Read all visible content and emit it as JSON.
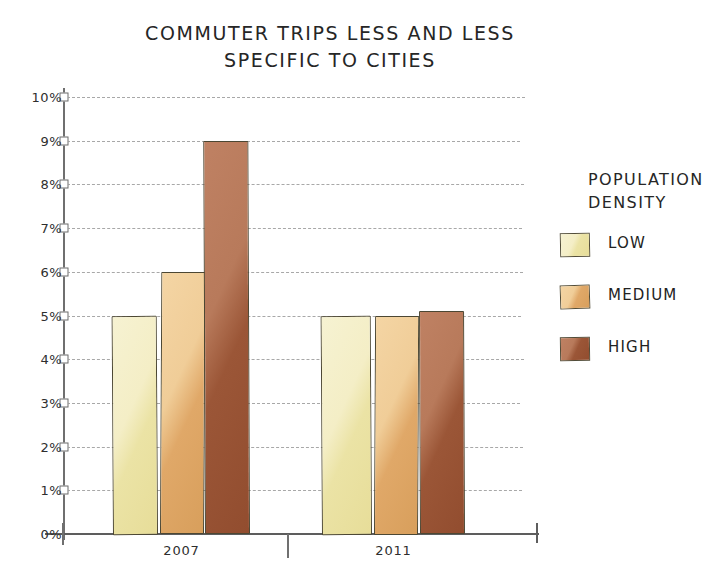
{
  "chart_data": {
    "type": "bar",
    "title": "COMMUTER TRIPS LESS AND LESS SPECIFIC TO CITIES",
    "title_line1": "COMMUTER TRIPS LESS AND LESS",
    "title_line2": "SPECIFIC TO  CITIES",
    "xlabel": "",
    "ylabel": "",
    "categories": [
      "2007",
      "2011"
    ],
    "ylim": [
      0,
      10
    ],
    "ytick_labels": [
      "0%",
      "1%",
      "2%",
      "3%",
      "4%",
      "5%",
      "6%",
      "7%",
      "8%",
      "9%",
      "10%"
    ],
    "ytick_values": [
      0,
      1,
      2,
      3,
      4,
      5,
      6,
      7,
      8,
      9,
      10
    ],
    "grid": true,
    "legend_position": "right",
    "legend_title": "POPULATION DENSITY",
    "legend_title_line1": "POPULATION",
    "legend_title_line2": "DENSITY",
    "series": [
      {
        "name": "LOW",
        "color": "#EFE8B4",
        "values": [
          5.0,
          5.0
        ]
      },
      {
        "name": "MEDIUM",
        "color": "#E5B070",
        "values": [
          6.0,
          5.0
        ]
      },
      {
        "name": "HIGH",
        "color": "#9E5936",
        "values": [
          9.0,
          5.1
        ]
      }
    ]
  },
  "axis": {
    "ticks": [
      {
        "label": "10%",
        "value": 10
      },
      {
        "label": "9%",
        "value": 9
      },
      {
        "label": "8%",
        "value": 8
      },
      {
        "label": "7%",
        "value": 7
      },
      {
        "label": "6%",
        "value": 6
      },
      {
        "label": "5%",
        "value": 5
      },
      {
        "label": "4%",
        "value": 4
      },
      {
        "label": "3%",
        "value": 3
      },
      {
        "label": "2%",
        "value": 2
      },
      {
        "label": "1%",
        "value": 1
      },
      {
        "label": "0%",
        "value": 0
      }
    ]
  },
  "groups": [
    {
      "label": "2007",
      "bars": [
        {
          "series": "LOW",
          "value": 5.0,
          "x": 113,
          "width": 45
        },
        {
          "series": "MEDIUM",
          "value": 6.0,
          "x": 160,
          "width": 44
        },
        {
          "series": "HIGH",
          "value": 9.0,
          "x": 205,
          "width": 45
        }
      ]
    },
    {
      "label": "2011",
      "bars": [
        {
          "series": "LOW",
          "value": 5.0,
          "x": 322,
          "width": 50
        },
        {
          "series": "MEDIUM",
          "value": 5.0,
          "x": 374,
          "width": 44
        },
        {
          "series": "HIGH",
          "value": 5.1,
          "x": 420,
          "width": 45
        }
      ]
    }
  ],
  "legend": {
    "title_line1": "POPULATION",
    "title_line2": "DENSITY",
    "items": [
      {
        "label": "LOW",
        "color": "#EFE8B4"
      },
      {
        "label": "MEDIUM",
        "color": "#E5B070"
      },
      {
        "label": "HIGH",
        "color": "#9E5936"
      }
    ]
  }
}
